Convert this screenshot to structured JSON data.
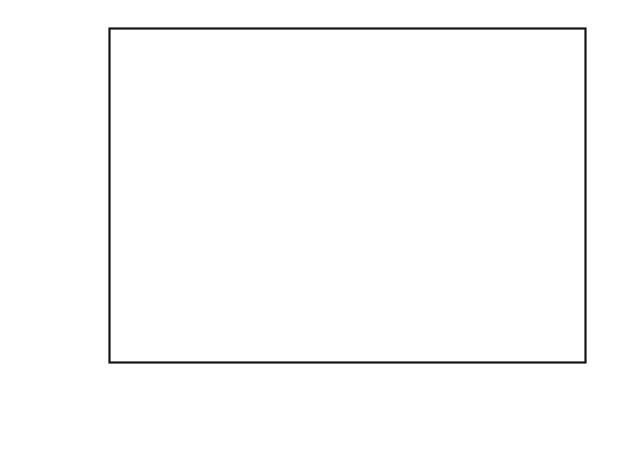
{
  "figure": {
    "background_color": "#ffffff",
    "line_color": "#2b2b2b",
    "marker_color": "#3d3d3d",
    "axis_color": "#151515"
  },
  "axes": {
    "x_title_main": "Energy (eV)",
    "y_title_prefix": "Cross section (10",
    "y_title_exponent": "−20",
    "y_title_suffix_a": " m",
    "y_title_suffix_b": "2",
    "y_title_close": ")",
    "x_tick_labels": [
      "0",
      "50",
      "100",
      "150",
      "200",
      "250"
    ],
    "y_tick_labels": [
      "0",
      "5",
      "10",
      "15",
      "20"
    ]
  },
  "legend": {
    "marker_name": "open-circle",
    "series_label": "Ionization",
    "formula_part1": "C",
    "formula_sub1": "2",
    "formula_part2": "HCl",
    "formula_sub2": "3"
  },
  "chart_data": {
    "type": "scatter",
    "title": "",
    "xlabel": "Energy (eV)",
    "ylabel": "Cross section (10^-20 m^2)",
    "xlim": [
      0,
      250
    ],
    "ylim": [
      0,
      20
    ],
    "x_ticks": [
      0,
      50,
      100,
      150,
      200,
      250
    ],
    "y_ticks": [
      0,
      5,
      10,
      15,
      20
    ],
    "x_minor_interval": 10,
    "y_minor_interval": 1,
    "grid": false,
    "legend_position": "center-right",
    "series": [
      {
        "name": "Ionization",
        "marker": "open-circle",
        "line": "solid",
        "x": [
          15,
          20,
          22.5,
          25,
          27.5,
          30,
          32.5,
          35,
          37.5,
          40,
          42.5,
          45,
          47.5,
          50,
          52.5,
          55,
          57.5,
          60,
          62.5,
          65,
          67.5,
          70,
          72.5,
          75,
          77.5,
          80,
          82.5,
          85,
          87.5,
          90,
          92.5,
          95,
          97.5,
          100,
          102.5,
          105,
          107.5,
          110,
          112.5,
          115,
          117.5,
          120,
          122.5,
          125,
          127.5,
          130,
          132.5,
          135,
          137.5,
          140,
          142.5,
          145,
          147.5,
          150,
          152.5,
          155,
          157.5,
          160,
          162.5,
          165,
          167.5,
          170,
          172.5,
          175,
          177.5,
          180,
          182.5,
          185,
          187.5,
          190,
          192.5,
          195,
          197.5,
          200,
          202.5,
          205,
          207.5,
          210,
          212.5,
          215,
          217.5,
          220
        ],
        "y": [
          2.8,
          6.3,
          9.2,
          11.3,
          12.8,
          14.0,
          14.9,
          15.6,
          16.1,
          16.5,
          16.8,
          17.05,
          17.25,
          17.4,
          17.5,
          17.6,
          17.65,
          17.7,
          17.75,
          17.8,
          17.82,
          17.85,
          17.88,
          17.9,
          17.92,
          17.95,
          17.93,
          17.9,
          17.88,
          17.85,
          17.8,
          17.75,
          17.7,
          17.65,
          17.6,
          17.5,
          17.4,
          17.3,
          17.2,
          17.1,
          17.0,
          16.95,
          16.9,
          16.85,
          16.8,
          16.7,
          16.6,
          16.5,
          16.4,
          16.3,
          16.2,
          16.1,
          16.0,
          15.9,
          15.8,
          15.7,
          15.6,
          15.5,
          15.42,
          15.38,
          15.35,
          15.33,
          15.35,
          15.32,
          15.25,
          15.1,
          14.9,
          14.7,
          14.5,
          14.35,
          14.2,
          14.1,
          14.0,
          13.95,
          13.9,
          13.88,
          13.88,
          13.9,
          13.92,
          13.95,
          13.92,
          13.85
        ]
      }
    ]
  }
}
